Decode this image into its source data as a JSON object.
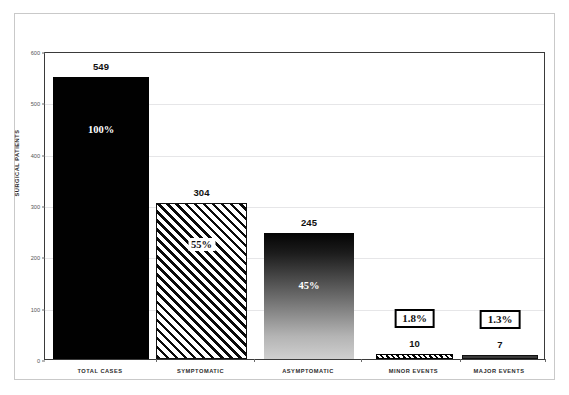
{
  "chart_data": {
    "type": "bar",
    "title": "",
    "xlabel": "",
    "ylabel": "SURGICAL PATIENTS",
    "ylim": [
      0,
      600
    ],
    "yticks": [
      0,
      100,
      200,
      300,
      400,
      500,
      600
    ],
    "ytick_labels": [
      "0",
      "100",
      "200",
      "300",
      "400",
      "500",
      "600"
    ],
    "grid": true,
    "legend": "none",
    "categories": [
      "TOTAL CASES",
      "SYMPTOMATIC",
      "ASYMPTOMATIC",
      "MINOR EVENTS",
      "MAJOR EVENTS"
    ],
    "values": [
      549,
      304,
      245,
      10,
      7
    ],
    "value_labels": [
      "549",
      "304",
      "245",
      "10",
      "7"
    ],
    "percent_labels": [
      "100%",
      "55%",
      "45%",
      "1.8%",
      "1.3%"
    ],
    "bars": [
      {
        "category": "TOTAL CASES",
        "value": 549,
        "value_label": "549",
        "percent_label": "100%",
        "percent_style": "inside-white-text",
        "fill": "solid-black",
        "color": "#010101"
      },
      {
        "category": "SYMPTOMATIC",
        "value": 304,
        "value_label": "304",
        "percent_label": "55%",
        "percent_style": "white-plate",
        "fill": "diagonal-hatch",
        "color": "#111111"
      },
      {
        "category": "ASYMPTOMATIC",
        "value": 245,
        "value_label": "245",
        "percent_label": "45%",
        "percent_style": "inside-white-text",
        "fill": "vertical-gradient",
        "color": "#6e6e6e"
      },
      {
        "category": "MINOR EVENTS",
        "value": 10,
        "value_label": "10",
        "percent_label": "1.8%",
        "percent_style": "boxed",
        "fill": "dense-diagonal-hatch",
        "color": "#000000"
      },
      {
        "category": "MAJOR EVENTS",
        "value": 7,
        "value_label": "7",
        "percent_label": "1.3%",
        "percent_style": "boxed",
        "fill": "solid-dark-gray",
        "color": "#3b3b3b"
      }
    ]
  },
  "axis": {
    "y_title": "SURGICAL PATIENTS"
  },
  "colors": {
    "plot_border": "#3a3a3a",
    "gridline": "#e6e6e8",
    "outer_frame": "#c9c9c9",
    "background": "#ffffff",
    "text": "#111111"
  }
}
